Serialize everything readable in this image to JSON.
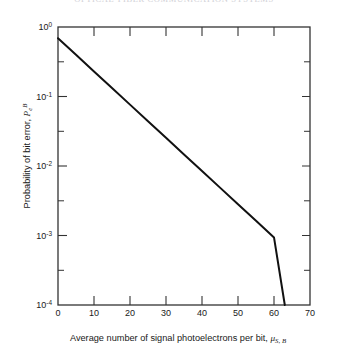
{
  "header": {
    "running_text": "OPTICAL-FIBER COMMUNICATION SYSTEMS"
  },
  "chart_data": {
    "type": "line",
    "title": "",
    "subtitle": "",
    "xlabel": "Average number of signal photoelectrons per bit, μS,B",
    "xlabel_text": "Average number of signal photoelectrons per bit,",
    "xlabel_symbol": "μ",
    "xlabel_symbol_sub": "S, B",
    "ylabel": "Probability of bit error, PeB",
    "ylabel_text": "Probability of bit error,",
    "ylabel_symbol": "P",
    "ylabel_symbol_sub": "e",
    "ylabel_symbol_sup": "B",
    "xscale": "linear",
    "yscale": "log",
    "xlim": [
      0,
      70
    ],
    "ylim": [
      0.0001,
      1
    ],
    "xticks": [
      0,
      10,
      20,
      30,
      40,
      50,
      60,
      70
    ],
    "xtick_labels": [
      "0",
      "10",
      "20",
      "30",
      "40",
      "50",
      "60",
      "70"
    ],
    "yticks": [
      1,
      0.1,
      0.01,
      0.001,
      0.0001
    ],
    "ytick_labels": [
      "10",
      "10",
      "10",
      "10",
      "10"
    ],
    "ytick_exponents": [
      "0",
      "-1",
      "-2",
      "-3",
      "-4"
    ],
    "y_minor_ticks": [
      0.3162,
      0.03162,
      0.003162,
      0.0003162
    ],
    "grid": false,
    "legend": false,
    "legend_position": "none",
    "line_color": "#111111",
    "line_width": 2.0,
    "frame_color": "#333333",
    "background": "#ffffff",
    "series": [
      {
        "name": "Probability of bit error",
        "x": [
          0,
          5,
          10,
          15,
          20,
          25,
          30,
          35,
          40,
          45,
          50,
          55,
          60,
          63
        ],
        "y": [
          0.69,
          0.398,
          0.2296,
          0.1325,
          0.0764,
          0.0441,
          0.02544,
          0.01468,
          0.00847,
          0.004886,
          0.002819,
          0.001626,
          0.000938,
          0.0001
        ]
      }
    ],
    "annotations": []
  }
}
